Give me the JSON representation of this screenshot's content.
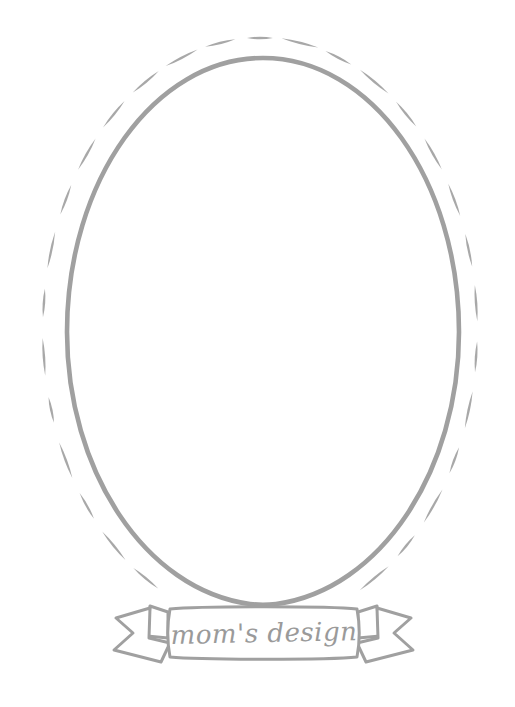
{
  "artwork": {
    "title": "mom's design oval frame",
    "background_color": "#ffffff",
    "stroke_color": "#a0a0a0",
    "stroke_color_light": "#b4b4b4",
    "text_color": "#9a9a9a",
    "canvas": {
      "width": 515,
      "height": 707
    }
  },
  "frame": {
    "inner_oval": {
      "shape": "ellipse",
      "style": "solid",
      "center_x": 263,
      "center_y": 332,
      "radius_x": 196,
      "radius_y": 274,
      "stroke_width": 4.5
    },
    "outer_oval": {
      "shape": "ellipse",
      "style": "dashed",
      "center_x": 260,
      "center_y": 330,
      "radius_x": 217,
      "radius_y": 292,
      "stroke_width": 5,
      "dash_count": 34
    }
  },
  "banner": {
    "label": "mom's design",
    "panel": {
      "x": 168,
      "y": 608,
      "width": 192,
      "height": 50
    },
    "left_tail": "notched-ribbon-end",
    "right_tail": "notched-ribbon-end",
    "fill": "#ffffff",
    "stroke_width": 3
  }
}
